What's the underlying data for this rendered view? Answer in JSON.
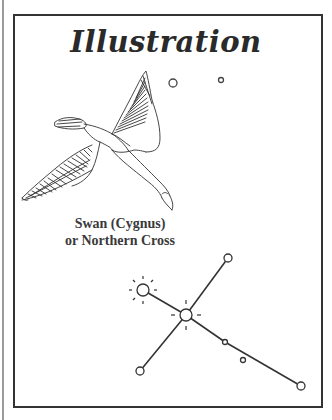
{
  "page": {
    "title": "Illustration",
    "caption": {
      "line1": "Swan (Cygnus)",
      "line2": "or Northern Cross"
    }
  },
  "illustration": {
    "subject": "swan-in-flight",
    "background_stars": [
      {
        "x": 173,
        "y": 83,
        "r": 4
      },
      {
        "x": 221,
        "y": 80,
        "r": 2.5
      }
    ]
  },
  "constellation": {
    "name": "Cygnus",
    "stars": [
      {
        "id": "deneb",
        "x": 143,
        "y": 290,
        "r": 6,
        "type": "bright"
      },
      {
        "id": "sadr",
        "x": 186,
        "y": 315,
        "r": 6,
        "type": "bright"
      },
      {
        "id": "top-right",
        "x": 228,
        "y": 258,
        "r": 4,
        "type": "normal"
      },
      {
        "id": "bottom-left",
        "x": 140,
        "y": 371,
        "r": 4,
        "type": "normal"
      },
      {
        "id": "mid-lower",
        "x": 225,
        "y": 342,
        "r": 2.5,
        "type": "faint"
      },
      {
        "id": "off-line",
        "x": 243,
        "y": 360,
        "r": 2.5,
        "type": "faint"
      },
      {
        "id": "bottom-right",
        "x": 301,
        "y": 386,
        "r": 4,
        "type": "normal"
      }
    ],
    "lines": [
      [
        "deneb",
        "sadr"
      ],
      [
        "sadr",
        "mid-lower"
      ],
      [
        "mid-lower",
        "bottom-right"
      ],
      [
        "top-right",
        "sadr"
      ],
      [
        "sadr",
        "bottom-left"
      ]
    ]
  },
  "colors": {
    "ink": "#2a2a2a",
    "frame": "#333333",
    "edge": "#9a9a9a",
    "paper": "#ffffff"
  }
}
